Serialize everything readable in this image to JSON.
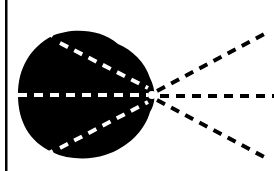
{
  "diagram": {
    "colors": {
      "background": "#ffffff",
      "blob": "#000000",
      "inner_dash": "#ffffff",
      "outer_dash": "#000000",
      "frame_line": "#000000"
    },
    "origin": {
      "x": 152,
      "y": 95
    },
    "rays": [
      {
        "name": "upper",
        "start": {
          "x": 52,
          "y": 40
        },
        "end": {
          "x": 268,
          "y": 32
        }
      },
      {
        "name": "middle",
        "start": {
          "x": 18,
          "y": 95
        },
        "end": {
          "x": 274,
          "y": 96
        }
      },
      {
        "name": "lower",
        "start": {
          "x": 52,
          "y": 150
        },
        "end": {
          "x": 266,
          "y": 158
        }
      }
    ]
  }
}
